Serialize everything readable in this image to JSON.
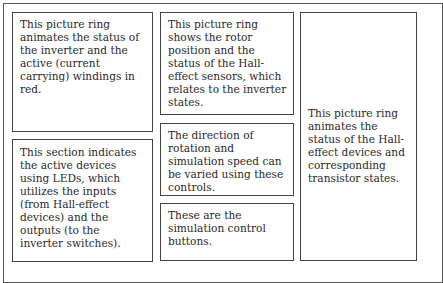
{
  "annotations": {
    "inverter_ring": "This picture ring animates the status of the inverter and the active (current carrying) windings in red.",
    "led_section": "This section indicates the active devices using LEDs, which utilizes the inputs (from Hall-effect devices) and the outputs (to the inverter switches).",
    "rotor_ring": "This picture ring shows the rotor position and the status of the Hall-effect sensors, which relates to the inverter states.",
    "direction_speed_controls": "The direction of rotation and simulation speed can be varied using these controls.",
    "simulation_buttons": "These are the simulation control buttons.",
    "hall_transistor_ring": "This picture ring animates the status of the Hall-effect devices and corresponding transistor states."
  }
}
